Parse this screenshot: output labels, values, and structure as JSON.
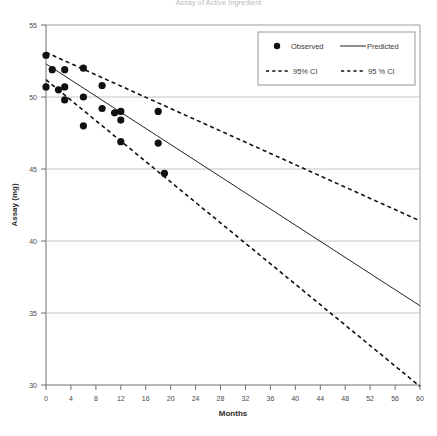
{
  "title": "Assay of Active Ingredient",
  "chart_data": {
    "type": "scatter",
    "title": "Assay of Active Ingredient",
    "xlabel": "Months",
    "ylabel": "Assay (mg)",
    "xlim": [
      0,
      60
    ],
    "ylim": [
      30,
      55
    ],
    "xticks": [
      0,
      4,
      8,
      12,
      16,
      20,
      24,
      28,
      32,
      36,
      40,
      44,
      48,
      52,
      56,
      60
    ],
    "yticks": [
      30,
      35,
      40,
      45,
      50,
      55
    ],
    "grid": "horizontal",
    "legend_position": "top-right",
    "series": [
      {
        "name": "Observed",
        "type": "scatter",
        "marker": "filled-circle",
        "color": "#111111",
        "points": [
          {
            "x": 0,
            "y": 52.9
          },
          {
            "x": 0,
            "y": 50.7
          },
          {
            "x": 1,
            "y": 51.9
          },
          {
            "x": 2,
            "y": 50.5
          },
          {
            "x": 3,
            "y": 51.9
          },
          {
            "x": 3,
            "y": 50.7
          },
          {
            "x": 3,
            "y": 49.8
          },
          {
            "x": 6,
            "y": 52.0
          },
          {
            "x": 6,
            "y": 50.0
          },
          {
            "x": 6,
            "y": 48.0
          },
          {
            "x": 9,
            "y": 50.8
          },
          {
            "x": 9,
            "y": 49.2
          },
          {
            "x": 11,
            "y": 48.9
          },
          {
            "x": 12,
            "y": 49.0
          },
          {
            "x": 12,
            "y": 48.4
          },
          {
            "x": 12,
            "y": 46.9
          },
          {
            "x": 18,
            "y": 49.0
          },
          {
            "x": 18,
            "y": 46.8
          },
          {
            "x": 19,
            "y": 44.7
          }
        ]
      },
      {
        "name": "Predicted",
        "type": "line",
        "style": "solid",
        "color": "#222222",
        "x": [
          0,
          60
        ],
        "y": [
          52.3,
          35.5
        ]
      },
      {
        "name": "95% CI",
        "type": "line",
        "style": "dashed",
        "color": "#111111",
        "x": [
          0,
          60
        ],
        "y": [
          53.1,
          41.4
        ]
      },
      {
        "name": "95 % CI",
        "type": "line",
        "style": "dashed",
        "color": "#111111",
        "x": [
          0,
          60
        ],
        "y": [
          51.2,
          29.9
        ]
      }
    ]
  },
  "legend": {
    "entries": [
      {
        "label": "Observed",
        "marker": "dot"
      },
      {
        "label": "Predicted",
        "marker": "solid-line"
      },
      {
        "label": "95% CI",
        "marker": "dashed-line"
      },
      {
        "label": "95 % CI",
        "marker": "dashed-line"
      }
    ]
  },
  "axes": {
    "x": {
      "label": "Months",
      "ticks": [
        "0",
        "4",
        "8",
        "12",
        "16",
        "20",
        "24",
        "28",
        "32",
        "36",
        "40",
        "44",
        "48",
        "52",
        "56",
        "60"
      ]
    },
    "y": {
      "label": "Assay (mg)",
      "ticks": [
        "55",
        "50",
        "45",
        "40",
        "35",
        "30"
      ]
    }
  }
}
